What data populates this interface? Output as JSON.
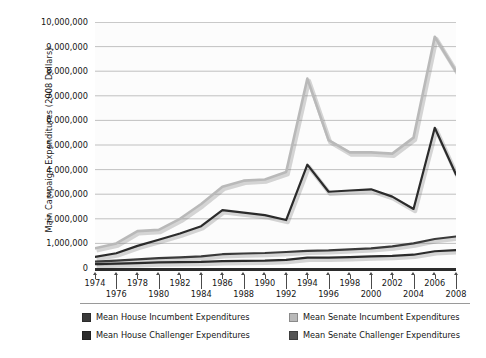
{
  "chart_data": {
    "type": "line",
    "title": "",
    "xlabel": "",
    "ylabel": "Main Campaign Expenditures (2008 Dollars)",
    "x": [
      1974,
      1976,
      1978,
      1980,
      1982,
      1984,
      1986,
      1988,
      1990,
      1992,
      1994,
      1996,
      1998,
      2000,
      2002,
      2004,
      2006,
      2008
    ],
    "xlim": [
      1974,
      2008
    ],
    "ylim": [
      0,
      10000000
    ],
    "ytick_labels": [
      "10,000,000",
      "9,000,000",
      "8,000,000",
      "7,000,000",
      "6,000,000",
      "5,000,000",
      "4,000,000",
      "3,000,000",
      "2,000,000",
      "1,000,000",
      "0"
    ],
    "ytick_values": [
      10000000,
      9000000,
      8000000,
      7000000,
      6000000,
      5000000,
      4000000,
      3000000,
      2000000,
      1000000,
      0
    ],
    "xtick_labels": [
      "1974",
      "1976",
      "1978",
      "1980",
      "1982",
      "1984",
      "1986",
      "1988",
      "1990",
      "1992",
      "1994",
      "1996",
      "1998",
      "2000",
      "2002",
      "2004",
      "2006",
      "2008"
    ],
    "grid": "horizontal",
    "legend_position": "bottom",
    "series": [
      {
        "name": "Mean House Incumbent Expenditures",
        "color": "#3a3a3a",
        "values": [
          260000,
          300000,
          350000,
          400000,
          430000,
          470000,
          560000,
          590000,
          610000,
          650000,
          700000,
          720000,
          760000,
          800000,
          880000,
          1000000,
          1180000,
          1280000
        ]
      },
      {
        "name": "Mean House Challenger Expenditures",
        "color": "#2b2b2b",
        "values": [
          160000,
          180000,
          200000,
          230000,
          240000,
          250000,
          280000,
          290000,
          300000,
          330000,
          420000,
          420000,
          440000,
          470000,
          490000,
          540000,
          680000,
          730000
        ]
      },
      {
        "name": "Mean Senate Incumbent Expenditures",
        "color": "#b9b9b9",
        "values": [
          800000,
          1000000,
          1500000,
          1550000,
          2000000,
          2600000,
          3300000,
          3550000,
          3600000,
          3900000,
          7700000,
          5200000,
          4700000,
          4700000,
          4650000,
          5300000,
          9400000,
          8000000
        ]
      },
      {
        "name": "Mean Senate Challenger Expenditures",
        "color": "#2b2b2b",
        "values": [
          450000,
          600000,
          900000,
          1150000,
          1400000,
          1700000,
          2350000,
          2250000,
          2150000,
          1950000,
          4200000,
          3100000,
          3150000,
          3200000,
          2900000,
          2400000,
          5700000,
          3800000
        ]
      }
    ]
  },
  "legend": {
    "items": [
      {
        "label": "Mean House Incumbent Expenditures",
        "color": "#3a3a3a"
      },
      {
        "label": "Mean House Challenger Expenditures",
        "color": "#2b2b2b"
      },
      {
        "label": "Mean Senate Incumbent Expenditures",
        "color": "#b9b9b9"
      },
      {
        "label": "Mean Senate Challenger Expenditures",
        "color": "#555555"
      }
    ]
  }
}
